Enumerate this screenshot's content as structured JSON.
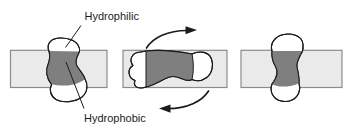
{
  "figure": {
    "labels": {
      "hydrophilic": "Hydrophilic",
      "hydrophobic": "Hydrophobic"
    },
    "icons": {
      "rotation_arrow_top": "curved-arrow-pointing-right",
      "rotation_arrow_bottom": "curved-arrow-pointing-left"
    }
  },
  "colors": {
    "background": "#ffffff",
    "membrane-fill": "#eaeaea",
    "membrane-border": "#8c8c8c",
    "hydrophobic-fill": "#7f7f7f",
    "outline": "#1c1c1c",
    "label-text": "#1c1c1c"
  }
}
